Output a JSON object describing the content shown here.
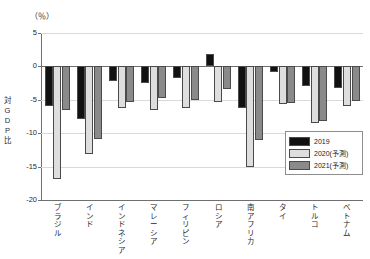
{
  "chart_data": {
    "type": "bar",
    "title": "",
    "unit_label": "（％）",
    "xlabel": "",
    "ylabel": "対GDP比",
    "ylabel_chars": [
      "対",
      "G",
      "D",
      "P",
      "比"
    ],
    "ylim": [
      -20,
      5
    ],
    "yticks": [
      5,
      0,
      -5,
      -10,
      -15,
      -20
    ],
    "ytick_labels": [
      "5",
      "0",
      "-5",
      "-10",
      "-15",
      "-20"
    ],
    "grid": true,
    "legend_position": "inside-right",
    "categories": [
      "ブラジル",
      "インド",
      "インドネシア",
      "マレーシア",
      "フィリピン",
      "ロシア",
      "南アフリカ",
      "タイ",
      "トルコ",
      "ベトナム"
    ],
    "category_chars": [
      [
        "ブ",
        "ラ",
        "ジ",
        "ル"
      ],
      [
        "イ",
        "ン",
        "ド"
      ],
      [
        "イ",
        "ン",
        "ド",
        "ネ",
        "シ",
        "ア"
      ],
      [
        "マ",
        "レ",
        "ー",
        "シ",
        "ア"
      ],
      [
        "フ",
        "ィ",
        "リ",
        "ピ",
        "ン"
      ],
      [
        "ロ",
        "シ",
        "ア"
      ],
      [
        "南",
        "ア",
        "フ",
        "リ",
        "カ"
      ],
      [
        "タ",
        "イ"
      ],
      [
        "ト",
        "ル",
        "コ"
      ],
      [
        "ベ",
        "ト",
        "ナ",
        "ム"
      ]
    ],
    "series": [
      {
        "name": "2019",
        "color": "#111111",
        "values": [
          -5.9,
          -7.9,
          -2.2,
          -2.5,
          -1.8,
          1.8,
          -6.3,
          -0.8,
          -2.9,
          -3.3
        ]
      },
      {
        "name": "2020(予測)",
        "color": "#dedede",
        "values": [
          -16.8,
          -13.1,
          -6.3,
          -6.5,
          -6.2,
          -5.4,
          -15.0,
          -5.6,
          -8.4,
          -6.0
        ]
      },
      {
        "name": "2021(予測)",
        "color": "#8a8a8a",
        "values": [
          -6.5,
          -10.8,
          -5.3,
          -4.8,
          -5.0,
          -3.4,
          -11.0,
          -5.5,
          -8.2,
          -5.2
        ]
      }
    ],
    "legend_entries": [
      "2019",
      "2020(予測)",
      "2021(予測)"
    ]
  }
}
